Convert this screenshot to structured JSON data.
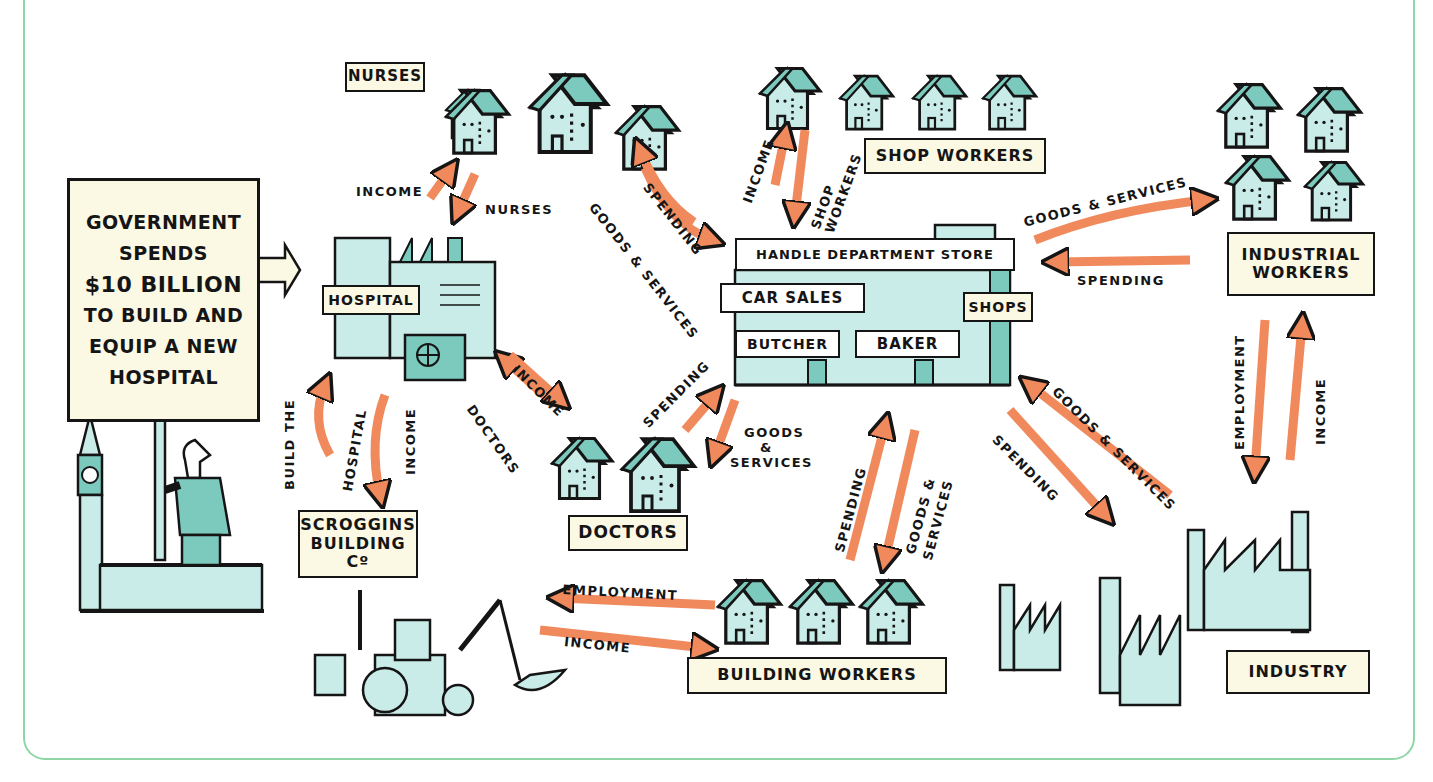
{
  "caption": "Spending creates a chain of income: government spending on a hospital flows through the economy",
  "government_box": {
    "lines": [
      "GOVERNMENT",
      "SPENDS",
      "$10 BILLION",
      "TO BUILD AND",
      "EQUIP A NEW",
      "HOSPITAL"
    ]
  },
  "labels": {
    "nurses": "NURSES",
    "hospital": "HOSPITAL",
    "shop_workers": "SHOP WORKERS",
    "department_store": "HANDLE DEPARTMENT STORE",
    "car_sales": "CAR SALES",
    "shops": "SHOPS",
    "butcher": "BUTCHER",
    "baker": "BAKER",
    "industrial_workers_1": "INDUSTRIAL",
    "industrial_workers_2": "WORKERS",
    "scroggins_1": "SCROGGINS",
    "scroggins_2": "BUILDING Cº",
    "doctors": "DOCTORS",
    "building_workers": "BUILDING WORKERS",
    "industry": "INDUSTRY"
  },
  "flows": {
    "nurses_income": "INCOME",
    "nurses_labour": "NURSES",
    "nurses_goods": "GOODS & SERVICES",
    "nurses_spending": "SPENDING",
    "shop_income": "INCOME",
    "shop_workers_1": "SHOP",
    "shop_workers_2": "WORKERS",
    "industrial_goods": "GOODS & SERVICES",
    "industrial_spending": "SPENDING",
    "build_the": "BUILD THE",
    "hospital": "HOSPITAL",
    "scroggins_income": "INCOME",
    "doctors_income": "INCOME",
    "doctors_labour": "DOCTORS",
    "doctors_spending": "SPENDING",
    "doctors_goods_1": "GOODS",
    "doctors_goods_2": "&",
    "doctors_goods_3": "SERVICES",
    "bw_spending": "SPENDING",
    "bw_goods_1": "GOODS &",
    "bw_goods_2": "SERVICES",
    "ind_spending": "SPENDING",
    "ind_goods": "GOODS & SERVICES",
    "iw_employment": "EMPLOYMENT",
    "iw_income": "INCOME",
    "employment": "EMPLOYMENT",
    "income": "INCOME"
  },
  "colors": {
    "arrow": "#f08a5d",
    "building": "#c9ece9",
    "roof": "#7ccabd",
    "label_bg": "#fbf8e4",
    "frame": "#8fd6a6",
    "ink": "#151515"
  }
}
